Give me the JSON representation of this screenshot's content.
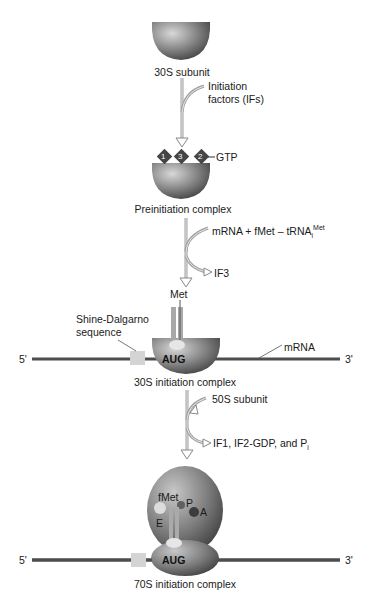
{
  "stages": {
    "s30": {
      "label": "30S subunit"
    },
    "step1": {
      "input": "Initiation factors (IFs)",
      "input_line1": "Initiation",
      "input_line2": "factors (IFs)"
    },
    "preinit": {
      "label": "Preinitiation complex",
      "factors": [
        "1",
        "3",
        "2"
      ],
      "gtp_label": "GTP"
    },
    "step2": {
      "input_main": "mRNA + fMet – tRNA",
      "input_sub": "i",
      "input_sup": "Met",
      "output": "IF3"
    },
    "init30": {
      "label": "30S initiation complex",
      "met_label": "Met",
      "sd_label_line1": "Shine-Dalgarno",
      "sd_label_line2": "sequence",
      "codon": "AUG",
      "mrna_label": "mRNA",
      "five_prime": "5'",
      "three_prime": "3'"
    },
    "step3": {
      "input": "50S subunit",
      "output_main": "IF1, IF2-GDP, and P",
      "output_sub": "i"
    },
    "init70": {
      "label": "70S initiation complex",
      "site_fmet": "fMet",
      "site_e": "E",
      "site_p": "P",
      "site_a": "A",
      "codon": "AUG",
      "five_prime": "5'",
      "three_prime": "3'"
    }
  },
  "colors": {
    "ribosome_dark": "#3a3a3a",
    "ribosome_light": "#bdbdbd",
    "factor": "#4a4a4a",
    "mrna": "#4d4d4d",
    "sd_box": "#d4d4d4",
    "arrow": "#9a9a9a"
  }
}
